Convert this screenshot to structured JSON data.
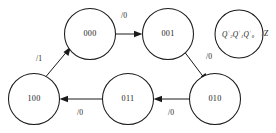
{
  "diagram": {
    "type": "state-transition-diagram",
    "title": "",
    "machine_style": "moore",
    "nodes": [
      {
        "id": "s000",
        "label": "000",
        "cx": 90,
        "cy": 34,
        "r": 25.5
      },
      {
        "id": "s001",
        "label": "001",
        "cx": 168,
        "cy": 34,
        "r": 25.5
      },
      {
        "id": "s010",
        "label": "010",
        "cx": 215,
        "cy": 99,
        "r": 25.5
      },
      {
        "id": "s011",
        "label": "011",
        "cx": 128,
        "cy": 99,
        "r": 25.5
      },
      {
        "id": "s100",
        "label": "100",
        "cx": 34,
        "cy": 99,
        "r": 25.5
      }
    ],
    "legend": {
      "id": "legend-node",
      "cx": 239,
      "cy": 34,
      "r": 24.0,
      "state_text": "Q2+Q1+Q0+",
      "q_symbol": "Q",
      "superscripts": [
        "+",
        "+",
        "+"
      ],
      "subscripts": [
        "2",
        "1",
        "0"
      ],
      "output_text": "/Z",
      "output_symbol": "Z",
      "separator": "/"
    },
    "edges": [
      {
        "id": "e000-001",
        "from": "s000",
        "to": "s001",
        "label": "/0",
        "label_x": 124,
        "label_y": 16
      },
      {
        "id": "e001-010",
        "from": "s001",
        "to": "s010",
        "label": "/0",
        "label_x": 209,
        "label_y": 57
      },
      {
        "id": "e010-011",
        "from": "s010",
        "to": "s011",
        "label": "/0",
        "label_x": 171,
        "label_y": 113
      },
      {
        "id": "e011-100",
        "from": "s011",
        "to": "s100",
        "label": "/0",
        "label_x": 80,
        "label_y": 113
      },
      {
        "id": "e100-000",
        "from": "s100",
        "to": "s000",
        "label": "/1",
        "label_x": 39,
        "label_y": 59
      }
    ],
    "colors": {
      "stroke": "#1a1a1a",
      "node_fill": "#ffffff",
      "background": "#ffffff",
      "text": "#1a1a1a"
    }
  }
}
